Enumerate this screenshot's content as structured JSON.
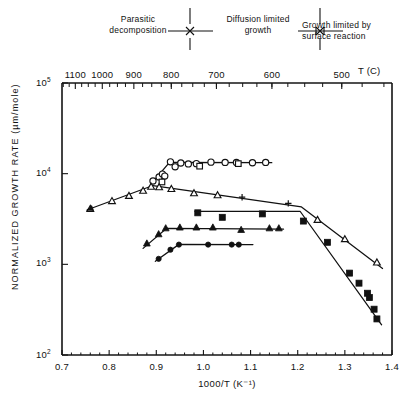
{
  "regimes": [
    {
      "id": "parasitic-decomposition",
      "line1": "Parasitic",
      "line2": "decomposition",
      "x": 138,
      "y": 14
    },
    {
      "id": "diffusion-limited-growth",
      "line1": "Diffusion limited",
      "line2": "growth",
      "x": 252,
      "y": 14
    },
    {
      "id": "growth-limited-by-surface-reaction",
      "line1": "Growth limited by",
      "line2": "surface reaction",
      "x": 370,
      "y": 20
    }
  ],
  "regime_dividers": [
    {
      "id": "divider-1",
      "x": 190
    },
    {
      "id": "divider-2",
      "x": 320
    }
  ],
  "chart_data": {
    "type": "scatter",
    "title": "",
    "xlabel": "1000/T (K⁻¹)",
    "ylabel": "NORMALIZED GROWTH RATE  (µm/mole)",
    "xlim": [
      0.7,
      1.4
    ],
    "ylim": [
      100,
      100000
    ],
    "yscale": "log",
    "grid": false,
    "legend": "none",
    "xticks": [
      "0.7",
      "0.8",
      "0.9",
      "1.0",
      "1.1",
      "1.2",
      "1.3",
      "1.4"
    ],
    "xtickvalues": [
      0.7,
      0.8,
      0.9,
      1.0,
      1.1,
      1.2,
      1.3,
      1.4
    ],
    "yticks": [
      "10⁵",
      "10⁴",
      "10³",
      "10²"
    ],
    "ytickvalues": [
      100000,
      10000,
      1000,
      100
    ],
    "secondary_axis": {
      "label": "T (C)",
      "unit": "C",
      "position": "top",
      "ticks": [
        "1100",
        "1000",
        "900",
        "800",
        "700",
        "600",
        "500"
      ],
      "tickvalues": [
        1100,
        1000,
        900,
        800,
        700,
        600,
        500
      ]
    },
    "series": [
      {
        "name": "open-circle-series",
        "marker": "circle-open",
        "points": [
          [
            0.893,
            8300
          ],
          [
            0.906,
            9200
          ],
          [
            0.913,
            9900
          ],
          [
            0.918,
            9400
          ],
          [
            0.93,
            13500
          ],
          [
            0.94,
            11900
          ],
          [
            0.952,
            13100
          ],
          [
            0.968,
            12800
          ],
          [
            0.985,
            12900
          ],
          [
            1.016,
            13400
          ],
          [
            1.046,
            13300
          ],
          [
            1.07,
            13300
          ],
          [
            1.104,
            13200
          ],
          [
            1.132,
            13300
          ]
        ],
        "line": [
          [
            0.888,
            7600
          ],
          [
            0.928,
            13300
          ],
          [
            1.145,
            13200
          ]
        ]
      },
      {
        "name": "open-square-series",
        "marker": "square-open",
        "points": [
          [
            0.912,
            8100
          ],
          [
            0.992,
            12100
          ],
          [
            1.074,
            12900
          ]
        ]
      },
      {
        "name": "open-triangle-series",
        "marker": "triangle-open",
        "points": [
          [
            0.76,
            4100
          ],
          [
            0.806,
            5000
          ],
          [
            0.842,
            5700
          ],
          [
            0.872,
            6500
          ],
          [
            0.889,
            7200
          ],
          [
            0.906,
            7100
          ],
          [
            0.932,
            6800
          ],
          [
            0.98,
            6100
          ],
          [
            1.03,
            5800
          ],
          [
            1.242,
            3100
          ],
          [
            1.3,
            1900
          ],
          [
            1.368,
            1050
          ]
        ],
        "line": [
          [
            0.754,
            4000
          ],
          [
            0.893,
            7400
          ],
          [
            1.208,
            4300
          ],
          [
            1.38,
            900
          ]
        ]
      },
      {
        "name": "plus-marker-series",
        "marker": "plus",
        "points": [
          [
            1.082,
            5500
          ],
          [
            1.18,
            4700
          ]
        ]
      },
      {
        "name": "filled-triangle-series",
        "marker": "triangle-filled",
        "points": [
          [
            0.88,
            1700
          ],
          [
            0.905,
            2150
          ],
          [
            0.92,
            2500
          ],
          [
            0.95,
            2550
          ],
          [
            0.985,
            2550
          ],
          [
            1.02,
            2550
          ],
          [
            1.08,
            2400
          ],
          [
            1.14,
            2500
          ],
          [
            1.16,
            2500
          ]
        ],
        "line": [
          [
            0.872,
            1500
          ],
          [
            0.922,
            2500
          ],
          [
            1.17,
            2450
          ]
        ]
      },
      {
        "name": "filled-circle-series",
        "marker": "circle-filled",
        "points": [
          [
            0.905,
            1150
          ],
          [
            0.93,
            1450
          ],
          [
            0.948,
            1650
          ],
          [
            1.01,
            1650
          ],
          [
            1.06,
            1650
          ],
          [
            1.075,
            1650
          ]
        ],
        "line": [
          [
            0.898,
            1080
          ],
          [
            0.948,
            1660
          ],
          [
            1.105,
            1650
          ]
        ]
      },
      {
        "name": "filled-square-series",
        "marker": "square-filled",
        "points": [
          [
            0.988,
            3700
          ],
          [
            1.04,
            3300
          ],
          [
            1.125,
            3600
          ],
          [
            1.212,
            3000
          ],
          [
            1.263,
            1750
          ],
          [
            1.31,
            800
          ],
          [
            1.33,
            620
          ],
          [
            1.348,
            480
          ],
          [
            1.352,
            430
          ],
          [
            1.362,
            320
          ],
          [
            1.368,
            250
          ]
        ],
        "line": [
          [
            0.982,
            3850
          ],
          [
            1.205,
            3850
          ],
          [
            1.378,
            215
          ]
        ]
      }
    ]
  }
}
